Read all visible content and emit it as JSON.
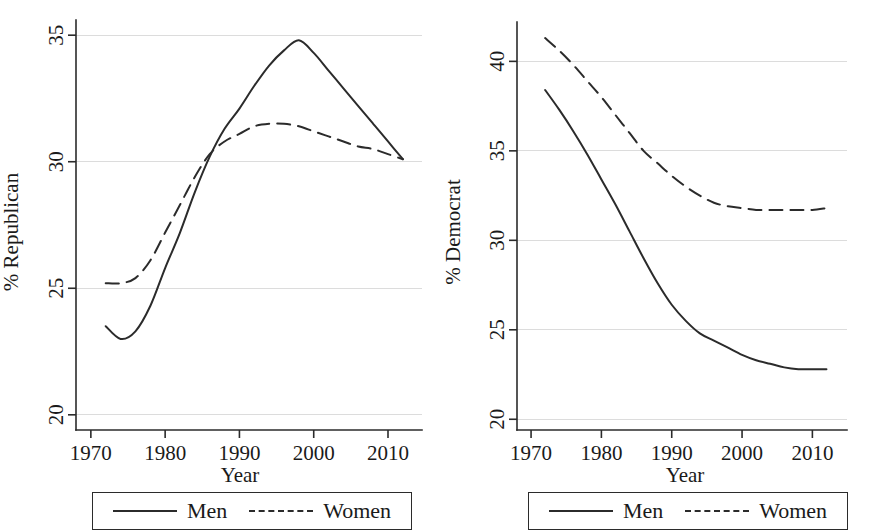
{
  "figure": {
    "panels": [
      {
        "id": "republican",
        "ylabel": "% Republican",
        "xlabel": "Year",
        "legend": {
          "entries": [
            {
              "label": "Men",
              "style": "solid"
            },
            {
              "label": "Women",
              "style": "dashed"
            }
          ]
        }
      },
      {
        "id": "democrat",
        "ylabel": "% Democrat",
        "xlabel": "Year",
        "legend": {
          "entries": [
            {
              "label": "Men",
              "style": "solid"
            },
            {
              "label": "Women",
              "style": "dashed"
            }
          ]
        }
      }
    ]
  },
  "chart_data": [
    {
      "type": "line",
      "title": "",
      "xlabel": "Year",
      "ylabel": "% Republican",
      "xlim": [
        1968,
        2013.5
      ],
      "ylim": [
        19.4,
        35.6
      ],
      "xticks": [
        1970,
        1980,
        1990,
        2000,
        2010
      ],
      "xticklabels": [
        "1970",
        "1980",
        "1990",
        "2000",
        "2010"
      ],
      "yticks": [
        20,
        25,
        30,
        35
      ],
      "yticklabels": [
        "20",
        "25",
        "30",
        "35"
      ],
      "grid": "horizontal",
      "legend_position": "below",
      "x": [
        1972,
        1974,
        1976,
        1978,
        1980,
        1982,
        1984,
        1986,
        1988,
        1990,
        1992,
        1994,
        1996,
        1998,
        2000,
        2002,
        2004,
        2006,
        2008,
        2010,
        2012
      ],
      "series": [
        {
          "name": "Men",
          "style": "solid",
          "values": [
            23.5,
            23.0,
            23.3,
            24.3,
            25.8,
            27.2,
            28.8,
            30.2,
            31.3,
            32.1,
            33.0,
            33.8,
            34.4,
            34.8,
            34.3,
            33.6,
            32.9,
            32.2,
            31.5,
            30.8,
            30.1
          ]
        },
        {
          "name": "Women",
          "style": "dashed",
          "values": [
            25.2,
            25.2,
            25.4,
            26.1,
            27.2,
            28.3,
            29.4,
            30.3,
            30.8,
            31.1,
            31.4,
            31.5,
            31.5,
            31.4,
            31.2,
            31.0,
            30.8,
            30.6,
            30.5,
            30.3,
            30.1
          ]
        }
      ]
    },
    {
      "type": "line",
      "title": "",
      "xlabel": "Year",
      "ylabel": "% Democrat",
      "xlim": [
        1968,
        2013.5
      ],
      "ylim": [
        19.4,
        42.2
      ],
      "xticks": [
        1970,
        1980,
        1990,
        2000,
        2010
      ],
      "xticklabels": [
        "1970",
        "1980",
        "1990",
        "2000",
        "2010"
      ],
      "yticks": [
        20,
        25,
        30,
        35,
        40
      ],
      "yticklabels": [
        "20",
        "25",
        "30",
        "35",
        "40"
      ],
      "grid": "horizontal",
      "legend_position": "below",
      "x": [
        1972,
        1974,
        1976,
        1978,
        1980,
        1982,
        1984,
        1986,
        1988,
        1990,
        1992,
        1994,
        1996,
        1998,
        2000,
        2002,
        2004,
        2006,
        2008,
        2010,
        2012
      ],
      "series": [
        {
          "name": "Men",
          "style": "solid",
          "values": [
            38.4,
            37.3,
            36.1,
            34.8,
            33.4,
            32.0,
            30.5,
            29.0,
            27.6,
            26.4,
            25.5,
            24.8,
            24.4,
            24.0,
            23.6,
            23.3,
            23.1,
            22.9,
            22.8,
            22.8,
            22.8
          ]
        },
        {
          "name": "Women",
          "style": "dashed",
          "values": [
            41.3,
            40.6,
            39.8,
            38.9,
            38.0,
            37.0,
            36.0,
            35.0,
            34.3,
            33.6,
            33.0,
            32.5,
            32.1,
            31.9,
            31.8,
            31.7,
            31.7,
            31.7,
            31.7,
            31.7,
            31.8
          ]
        }
      ]
    }
  ]
}
